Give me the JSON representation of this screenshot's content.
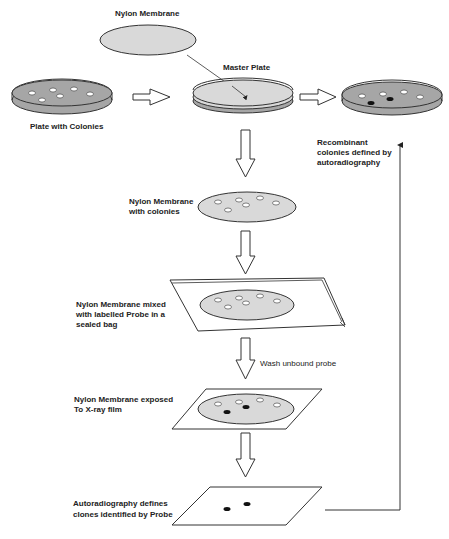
{
  "labels": {
    "nylon_membrane_top": "Nylon Membrane",
    "master_plate": "Master Plate",
    "plate_with_colonies": "Plate with Colonies",
    "recombinant_1": "Recombinant",
    "recombinant_2": "colonies  defined by",
    "recombinant_3": "autoradiography",
    "membrane_colonies_1": "Nylon Membrane",
    "membrane_colonies_2": "with colonies",
    "sealed_bag_1": "Nylon Membrane mixed",
    "sealed_bag_2": "with labelled Probe in a",
    "sealed_bag_3": "sealed bag",
    "wash": "Wash unbound probe",
    "xray_1": "Nylon Membrane exposed",
    "xray_2": "To X-ray film",
    "autorad_1": "Autoradiography defines",
    "autorad_2": "clones identified by Probe"
  },
  "colors": {
    "plate_fill": "#a6a6a6",
    "membrane_fill": "#d9d9d9",
    "outline": "#333333",
    "positive_colony": "#111111",
    "negative_colony": "#ffffff"
  },
  "steps": [
    {
      "name": "plate-with-colonies",
      "colonies": 6,
      "positive": 0
    },
    {
      "name": "master-plate",
      "colonies": 0,
      "positive": 0
    },
    {
      "name": "recombinant-plate",
      "colonies": 6,
      "positive": 2
    },
    {
      "name": "membrane-with-colonies",
      "colonies": 6,
      "positive": 0
    },
    {
      "name": "sealed-bag",
      "colonies": 6,
      "positive": 0
    },
    {
      "name": "xray-film",
      "colonies": 6,
      "positive": 2
    },
    {
      "name": "autoradiograph",
      "colonies": 2,
      "positive": 2
    }
  ]
}
